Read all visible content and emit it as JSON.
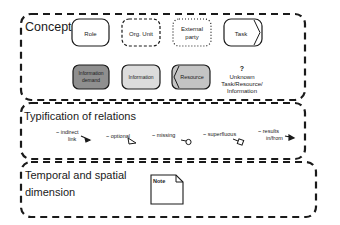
{
  "panels": {
    "concepts": {
      "title": "Concepts",
      "items": {
        "role": "Role",
        "org_unit": "Org. Unit",
        "external_party_1": "External",
        "external_party_2": "party",
        "task": "Task",
        "information_demand_1": "Information",
        "information_demand_2": "demand",
        "information": "Information",
        "resource": "Resource",
        "unknown_q": "?",
        "unknown_1": "Unknown",
        "unknown_2": "Task/Resource/",
        "unknown_3": "Information"
      }
    },
    "relations": {
      "title": "Typification of relations",
      "items": {
        "indirect_1": "~ indirect",
        "indirect_2": "link",
        "optional": "~ optional",
        "missing": "~ missing",
        "superfluous": "~ superfluous",
        "results_1": "~ results",
        "results_2": "in/from"
      }
    },
    "temporal": {
      "title_1": "Temporal and spatial",
      "title_2": "dimension",
      "note": "Note"
    }
  },
  "colors": {
    "information_demand": "#8f8f8f",
    "information": "#dcdcdc",
    "resource": "#c4c4c4",
    "stroke": "#1a1a1a"
  }
}
